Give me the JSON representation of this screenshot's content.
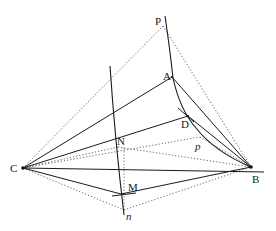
{
  "diagram": {
    "type": "geometric-construction",
    "points": {
      "C": {
        "label": "C",
        "x": 23,
        "y": 168
      },
      "B": {
        "label": "B",
        "x": 251,
        "y": 167
      },
      "P": {
        "label": "P",
        "x": 164,
        "y": 25
      },
      "A": {
        "label": "A",
        "x": 172,
        "y": 77
      },
      "D": {
        "label": "D",
        "x": 188,
        "y": 116
      },
      "N": {
        "label": "N",
        "x": 117,
        "y": 137
      },
      "M": {
        "label": "M",
        "x": 121,
        "y": 194
      }
    },
    "curve_labels": {
      "p": {
        "label": "p",
        "x": 197,
        "y": 148
      },
      "n": {
        "label": "n",
        "x": 128,
        "y": 218
      }
    },
    "colors": {
      "line": "#1a1a1a",
      "dotted": "#555555",
      "background": "#ffffff"
    }
  }
}
